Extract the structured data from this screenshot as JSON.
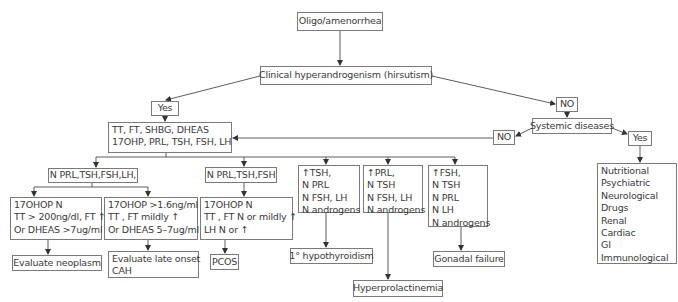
{
  "diagram": {
    "type": "flowchart",
    "root": "Oligo/amenorrhea",
    "nodes": {
      "oligo": {
        "label": "Oligo/amenorrhea"
      },
      "clinical": {
        "label": "Clinical hyperandrogenism (hirsutism)"
      },
      "yes_left": {
        "label": "Yes"
      },
      "no_right": {
        "label": "NO"
      },
      "labs": {
        "lines": [
          "TT, FT, SHBG, DHEAS",
          "17OHP, PRL, TSH, FSH, LH"
        ]
      },
      "systemic": {
        "label": "Systemic diseases"
      },
      "no_systemic": {
        "label": "NO"
      },
      "yes_systemic": {
        "label": "Yes"
      },
      "systemic_causes": {
        "lines": [
          "Nutritional",
          "Psychiatric",
          "Neurological",
          "Drugs",
          "Renal",
          "Cardiac",
          "GI",
          "Immunological"
        ]
      },
      "n_prl_tsh_fsh_lh": {
        "label": "N PRL,TSH,FSH,LH,"
      },
      "n_prl_tsh_fsh": {
        "label": "N PRL,TSH,FSH"
      },
      "high_tsh": {
        "lines": [
          "↑TSH,",
          "N PRL",
          "N FSH, LH",
          "N androgens"
        ]
      },
      "high_prl": {
        "lines": [
          "↑PRL,",
          "N TSH",
          "N FSH, LH",
          "N androgens"
        ]
      },
      "high_fsh": {
        "lines": [
          "↑FSH,",
          "N TSH",
          "N PRL",
          "N LH",
          "N androgens"
        ]
      },
      "neoplasm_criteria": {
        "lines": [
          "17OHOP N",
          "TT > 200ng/dl, FT ↑",
          "Or DHEAS >7ug/ml"
        ]
      },
      "cah_criteria": {
        "lines": [
          "17OHOP >1.6ng/ml",
          "TT , FT mildly ↑",
          "Or DHEAS 5–7ug/ml"
        ]
      },
      "pcos_criteria": {
        "lines": [
          "17OHOP N",
          "TT , FT N or mildly ↑",
          "LH N or ↑"
        ]
      },
      "evaluate_neoplasm": {
        "label": "Evaluate neoplasm"
      },
      "evaluate_cah": {
        "lines": [
          "Evaluate late onset",
          "CAH"
        ]
      },
      "pcos": {
        "label": "PCOS"
      },
      "hypothyroidism": {
        "label": "1° hypothyroidism"
      },
      "hyperprolactinemia": {
        "label": "Hyperprolactinemia"
      },
      "gonadal_failure": {
        "label": "Gonadal failure"
      }
    },
    "edges": [
      [
        "oligo",
        "clinical"
      ],
      [
        "clinical",
        "yes_left"
      ],
      [
        "clinical",
        "no_right"
      ],
      [
        "yes_left",
        "labs"
      ],
      [
        "no_right",
        "systemic"
      ],
      [
        "systemic",
        "no_systemic"
      ],
      [
        "systemic",
        "yes_systemic"
      ],
      [
        "no_systemic",
        "labs"
      ],
      [
        "yes_systemic",
        "systemic_causes"
      ],
      [
        "labs",
        "n_prl_tsh_fsh_lh"
      ],
      [
        "labs",
        "n_prl_tsh_fsh"
      ],
      [
        "labs",
        "high_tsh"
      ],
      [
        "labs",
        "high_prl"
      ],
      [
        "labs",
        "high_fsh"
      ],
      [
        "n_prl_tsh_fsh_lh",
        "neoplasm_criteria"
      ],
      [
        "n_prl_tsh_fsh_lh",
        "cah_criteria"
      ],
      [
        "n_prl_tsh_fsh",
        "pcos_criteria"
      ],
      [
        "neoplasm_criteria",
        "evaluate_neoplasm"
      ],
      [
        "cah_criteria",
        "evaluate_cah"
      ],
      [
        "pcos_criteria",
        "pcos"
      ],
      [
        "high_tsh",
        "hypothyroidism"
      ],
      [
        "high_prl",
        "hyperprolactinemia"
      ],
      [
        "high_fsh",
        "gonadal_failure"
      ]
    ],
    "colors": {
      "line": "#4a4a4a",
      "border": "#7a7a7a",
      "text": "#3a3a3a",
      "background": "#ffffff"
    }
  }
}
